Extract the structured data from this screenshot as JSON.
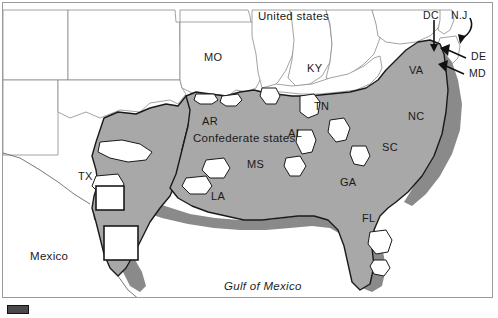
{
  "map": {
    "title": "Confederate states map",
    "colors": {
      "confederate_fill": "#a8a8a8",
      "union_fill": "#ffffff",
      "coastal_shade": "#8a8a8a",
      "border_line": "#1a1a1a",
      "thin_border": "#8c8c8c",
      "frame": "#9a9a9a",
      "legend_swatch": "#4a4a4a"
    },
    "regions": {
      "united_states": "United states",
      "confederate_states": "Confederate states",
      "mexico": "Mexico",
      "gulf_of_mexico": "Gulf of Mexico"
    },
    "states": [
      {
        "code": "MO",
        "x": 204,
        "y": 51,
        "confederate": false
      },
      {
        "code": "KY",
        "x": 307,
        "y": 62,
        "confederate": false
      },
      {
        "code": "VA",
        "x": 409,
        "y": 64,
        "confederate": true
      },
      {
        "code": "AR",
        "x": 202,
        "y": 115,
        "confederate": true
      },
      {
        "code": "TN",
        "x": 314,
        "y": 100,
        "confederate": true
      },
      {
        "code": "NC",
        "x": 408,
        "y": 110,
        "confederate": true
      },
      {
        "code": "AL",
        "x": 288,
        "y": 127,
        "confederate": true
      },
      {
        "code": "SC",
        "x": 382,
        "y": 141,
        "confederate": true
      },
      {
        "code": "MS",
        "x": 247,
        "y": 158,
        "confederate": true
      },
      {
        "code": "GA",
        "x": 340,
        "y": 176,
        "confederate": true
      },
      {
        "code": "LA",
        "x": 211,
        "y": 190,
        "confederate": true
      },
      {
        "code": "TX",
        "x": 78,
        "y": 170,
        "confederate": true
      },
      {
        "code": "FL",
        "x": 362,
        "y": 212,
        "confederate": true
      }
    ],
    "callouts": [
      {
        "code": "DC",
        "x": 428,
        "y": 12
      },
      {
        "code": "N.J",
        "x": 458,
        "y": 12
      },
      {
        "code": "DE",
        "x": 470,
        "y": 54
      },
      {
        "code": "MD",
        "x": 468,
        "y": 70
      }
    ],
    "legend": {
      "swatch_color": "#4a4a4a"
    }
  }
}
